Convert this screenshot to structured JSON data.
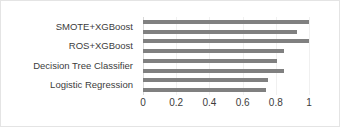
{
  "chart_data": {
    "type": "bar",
    "orientation": "horizontal",
    "title": "",
    "subtitle": "",
    "xlabel": "",
    "ylabel": "",
    "xlim": [
      0,
      1
    ],
    "xticks": [
      "0",
      "0.2",
      "0.4",
      "0.6",
      "0.8",
      "1"
    ],
    "xtick_values": [
      0,
      0.2,
      0.4,
      0.6,
      0.8,
      1
    ],
    "grid": true,
    "grid_axis": "x",
    "legend": false,
    "legend_position": "none",
    "bar_color": "#808080",
    "categories": [
      "SMOTE+XGBoost",
      "ROS+XGBoost",
      "Decision Tree Classifier",
      "Logistic Regression"
    ],
    "bars_per_category": 2,
    "series": [
      {
        "name": "Series 1",
        "values": [
          1.0,
          1.0,
          0.81,
          0.75
        ]
      },
      {
        "name": "Series 2",
        "values": [
          0.93,
          0.85,
          0.85,
          0.74
        ]
      }
    ],
    "bars": [
      {
        "category": "SMOTE+XGBoost",
        "series": "Series 1",
        "value": 1.0
      },
      {
        "category": "SMOTE+XGBoost",
        "series": "Series 2",
        "value": 0.93
      },
      {
        "category": "ROS+XGBoost",
        "series": "Series 1",
        "value": 1.0
      },
      {
        "category": "ROS+XGBoost",
        "series": "Series 2",
        "value": 0.85
      },
      {
        "category": "Decision Tree Classifier",
        "series": "Series 1",
        "value": 0.81
      },
      {
        "category": "Decision Tree Classifier",
        "series": "Series 2",
        "value": 0.85
      },
      {
        "category": "Logistic Regression",
        "series": "Series 1",
        "value": 0.75
      },
      {
        "category": "Logistic Regression",
        "series": "Series 2",
        "value": 0.74
      }
    ]
  }
}
